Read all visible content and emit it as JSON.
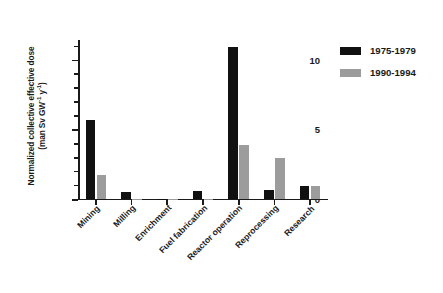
{
  "chart_data": {
    "type": "bar",
    "title": "",
    "xlabel": "",
    "ylabel_line1": "Normalized collective effective dose",
    "ylabel_line2_prefix": "(man Sv GW",
    "ylabel_line2_sup1": "-1",
    "ylabel_line2_mid": " y",
    "ylabel_line2_sup2": "-1",
    "ylabel_line2_suffix": ")",
    "categories": [
      "Mining",
      "Milling",
      "Enrichment",
      "Fuel fabrication",
      "Reactor operation",
      "Reprocessing",
      "Research"
    ],
    "series": [
      {
        "name": "1975-1979",
        "color": "#111111",
        "values": [
          5.7,
          0.5,
          0.02,
          0.6,
          10.9,
          0.65,
          0.95
        ]
      },
      {
        "name": "1990-1994",
        "color": "#9c9c9c",
        "values": [
          1.75,
          0.03,
          0.01,
          0.02,
          3.85,
          2.95,
          0.9
        ]
      }
    ],
    "ylim": [
      0,
      11.4
    ],
    "yticks_major": [
      0,
      5,
      10
    ],
    "yticks_minor": [
      1,
      2,
      3,
      4,
      6,
      7,
      8,
      9,
      11
    ],
    "ytick_labels": [
      "0",
      "5",
      "10"
    ],
    "grid": false,
    "legend_position": "right",
    "axis_color": "#1a1a1a"
  },
  "legend": {
    "entries": [
      {
        "label": "1975-1979"
      },
      {
        "label": "1990-1994"
      }
    ]
  }
}
